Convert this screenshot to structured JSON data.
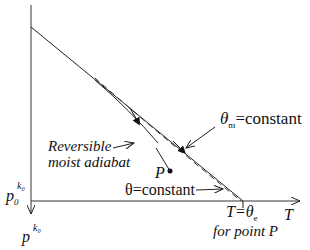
{
  "diagram": {
    "axes": {
      "x_label": "T",
      "y_origin_label_base": "p",
      "y_origin_label_sub": "0",
      "y_origin_label_sup": "k₀",
      "y_axis_label_base": "p",
      "y_axis_label_sup": "k₀"
    },
    "labels": {
      "theta_m": "θ",
      "theta_m_sub": "m",
      "theta_m_rest": "=constant",
      "reversible_1": "Reversible",
      "reversible_2": "moist adiabat",
      "point": "P",
      "theta_const": "θ=constant",
      "te_T": "T=",
      "te_theta": "θ",
      "te_sub": "e",
      "for_point": "for point P"
    },
    "colors": {
      "line": "#222222"
    }
  }
}
